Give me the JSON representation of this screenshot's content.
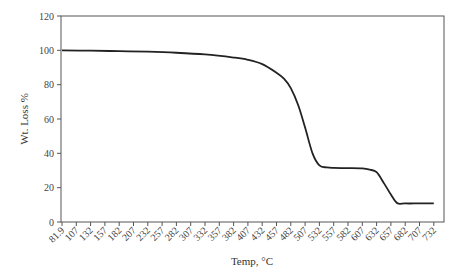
{
  "chart_data": {
    "type": "line",
    "title": "",
    "xlabel": "Temp, °C",
    "ylabel": "Wt. Loss %",
    "ylim": [
      0,
      120
    ],
    "yticks": [
      0,
      20,
      40,
      60,
      80,
      100,
      120
    ],
    "xtick_labels": [
      "81.9",
      "107",
      "132",
      "157",
      "182",
      "207",
      "232",
      "257",
      "282",
      "307",
      "332",
      "357",
      "382",
      "407",
      "432",
      "457",
      "482",
      "507",
      "532",
      "557",
      "582",
      "607",
      "632",
      "657",
      "682",
      "707",
      "732"
    ],
    "grid": false,
    "legend": null,
    "series": [
      {
        "name": "Wt. Loss %",
        "color": "#222222",
        "x": [
          81.9,
          132,
          182,
          232,
          282,
          332,
          382,
          407,
          432,
          457,
          470,
          482,
          495,
          507,
          520,
          532,
          545,
          557,
          582,
          607,
          620,
          632,
          645,
          657,
          668,
          682,
          707,
          732
        ],
        "y": [
          100,
          99.8,
          99.5,
          99.2,
          98.6,
          97.6,
          95.8,
          94.5,
          92.0,
          87.0,
          83.5,
          78.0,
          68.0,
          55.0,
          40.0,
          33.0,
          31.8,
          31.5,
          31.4,
          31.2,
          30.5,
          29.0,
          22.5,
          16.0,
          11.0,
          10.8,
          10.8,
          10.8
        ]
      }
    ]
  }
}
